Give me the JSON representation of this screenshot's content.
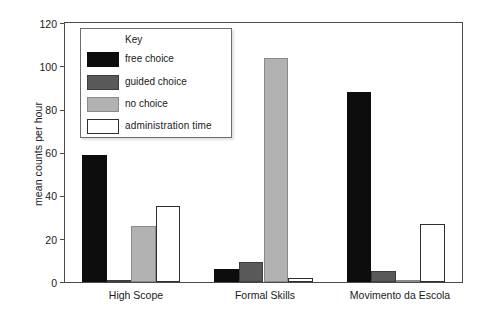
{
  "chart_data": {
    "type": "bar",
    "title": "",
    "xlabel": "",
    "ylabel": "mean counts per hour",
    "ylim": [
      0,
      120
    ],
    "yticks": [
      0,
      20,
      40,
      60,
      80,
      100,
      120
    ],
    "grid": false,
    "legend": {
      "position": "inside-top-left",
      "title": "Key",
      "entries": [
        {
          "name": "free choice",
          "color": "#0d0d0d"
        },
        {
          "name": "guided choice",
          "color": "#595959"
        },
        {
          "name": "no choice",
          "color": "#b2b2b2"
        },
        {
          "name": "administration time",
          "color": "#ffffff"
        }
      ]
    },
    "categories": [
      "High Scope",
      "Formal Skills",
      "Movimento da Escola"
    ],
    "series": [
      {
        "name": "free choice",
        "color": "#0d0d0d",
        "values": [
          59,
          6,
          88
        ]
      },
      {
        "name": "guided choice",
        "color": "#595959",
        "values": [
          1,
          9.5,
          5
        ]
      },
      {
        "name": "no choice",
        "color": "#b2b2b2",
        "values": [
          26,
          104,
          1
        ]
      },
      {
        "name": "administration time",
        "color": "#ffffff",
        "values": [
          35,
          2,
          27
        ]
      }
    ]
  },
  "axis": {
    "y_title": "mean counts per hour",
    "ticks": [
      "120",
      "100",
      "80",
      "60",
      "40",
      "20",
      "0"
    ]
  },
  "legend": {
    "title": "Key",
    "items": [
      {
        "label": "free choice"
      },
      {
        "label": "guided choice"
      },
      {
        "label": "no choice"
      },
      {
        "label": "administration time"
      }
    ]
  },
  "groups": [
    {
      "label": "High Scope"
    },
    {
      "label": "Formal Skills"
    },
    {
      "label": "Movimento da Escola"
    }
  ]
}
